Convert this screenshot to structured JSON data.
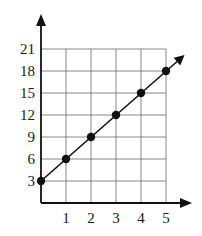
{
  "chart_data": {
    "type": "line",
    "title": "",
    "xlabel": "",
    "ylabel": "",
    "x": [
      0,
      1,
      2,
      3,
      4,
      5
    ],
    "series": [
      {
        "name": "y = 3x + 3",
        "values": [
          3,
          6,
          9,
          12,
          15,
          18
        ],
        "markers": true,
        "arrow_end": true
      }
    ],
    "x_ticks": [
      "1",
      "2",
      "3",
      "4",
      "5"
    ],
    "y_ticks": [
      "3",
      "6",
      "9",
      "12",
      "15",
      "18",
      "21"
    ],
    "xlim": [
      0,
      5
    ],
    "ylim": [
      0,
      21
    ],
    "grid": true,
    "legend": "none",
    "colors": {
      "line": "#111111",
      "grid": "#555555",
      "axis": "#111111"
    }
  }
}
